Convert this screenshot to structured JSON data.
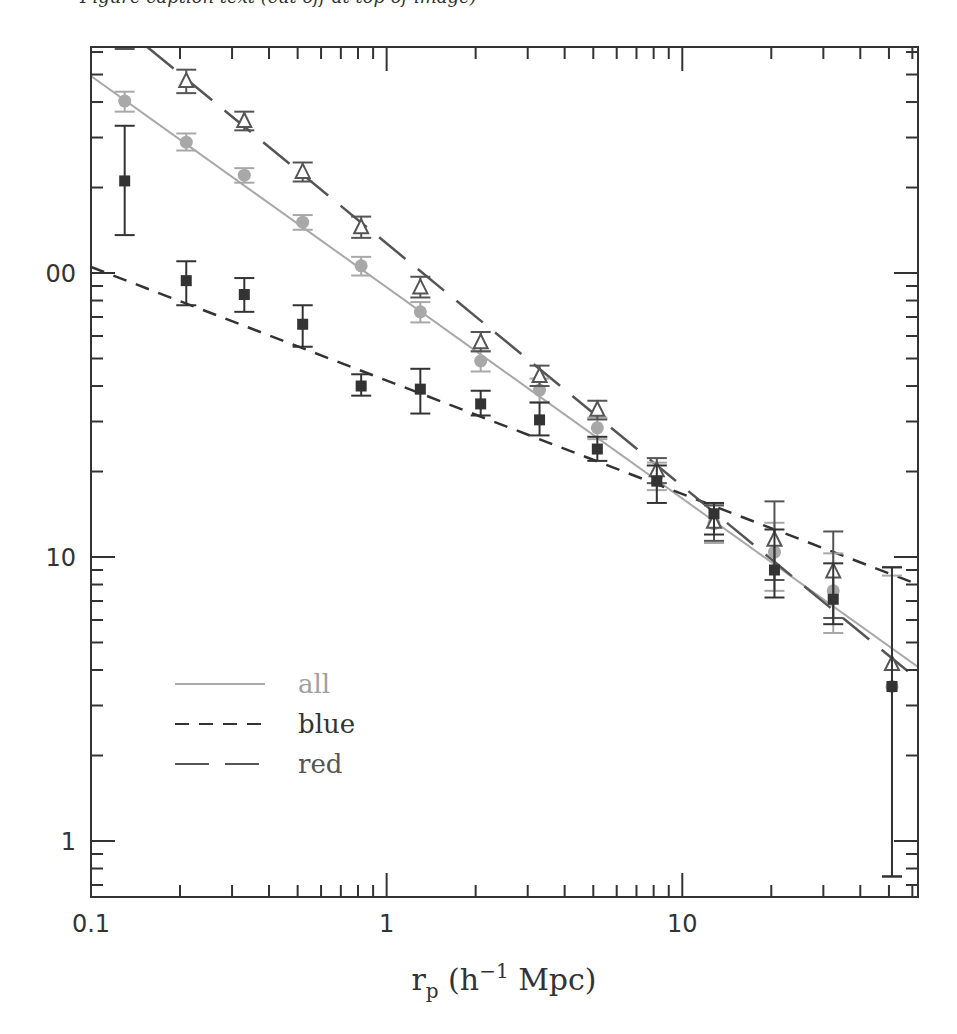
{
  "caption_fragment": "Figure caption text (cut off at top of image)",
  "chart_data": {
    "type": "scatter",
    "title": "",
    "xlabel": "r_p (h^-1 Mpc)",
    "xlabel_parts": {
      "main": "r",
      "sub": "p",
      "open": " (h",
      "sup": "−1",
      "close": " Mpc)"
    },
    "ylabel": "",
    "xscale": "log",
    "yscale": "log",
    "xlim": [
      0.1,
      62.7
    ],
    "ylim": [
      0.635,
      625
    ],
    "xticks": [
      {
        "value": 0.1,
        "label": "0.1"
      },
      {
        "value": 1,
        "label": "1"
      },
      {
        "value": 10,
        "label": "10"
      }
    ],
    "yticks": [
      {
        "value": 1,
        "label": "1"
      },
      {
        "value": 10,
        "label": "10"
      },
      {
        "value": 100,
        "label": "00"
      }
    ],
    "grid": false,
    "legend": {
      "position": "lower-left",
      "entries": [
        {
          "label": "all",
          "style": "solid",
          "color": "#a8a8a8",
          "text_color": "#a0a0a0"
        },
        {
          "label": "blue",
          "style": "short-dash",
          "color": "#333333",
          "text_color": "#333333"
        },
        {
          "label": "red",
          "style": "long-dash",
          "color": "#555555",
          "text_color": "#555555"
        }
      ]
    },
    "x": [
      0.13,
      0.21,
      0.33,
      0.52,
      0.82,
      1.3,
      2.08,
      3.29,
      5.16,
      8.2,
      12.8,
      20.5,
      32.4,
      51.2
    ],
    "series": [
      {
        "name": "all",
        "marker": "circle",
        "color": "#a8a8a8",
        "values": [
          403,
          289,
          221,
          151,
          106,
          73,
          49,
          38.7,
          28.5,
          19.3,
          13.1,
          10.4,
          7.6,
          3.5
        ],
        "err_lo": [
          370,
          270,
          208,
          142,
          98,
          67,
          45,
          35,
          26,
          17.2,
          11.2,
          7.6,
          5.4,
          0.75
        ],
        "err_hi": [
          435,
          310,
          234,
          160,
          114,
          79,
          53,
          42.5,
          31,
          21.5,
          15.2,
          13.2,
          10.3,
          8.6
        ],
        "fit": {
          "x": [
            0.1,
            62.7
          ],
          "y": [
            494,
            4.1
          ]
        }
      },
      {
        "name": "blue",
        "marker": "square",
        "color": "#333333",
        "values": [
          211,
          94,
          84,
          66,
          40,
          39,
          34.6,
          30.4,
          24,
          18.5,
          14.2,
          9.0,
          7.1,
          3.5
        ],
        "err_lo": [
          136,
          77,
          73,
          55,
          37,
          32,
          31.5,
          26.8,
          21.8,
          15.5,
          12,
          7.2,
          5.8,
          0.75
        ],
        "err_hi": [
          330,
          110,
          96,
          77,
          44,
          46,
          38.5,
          35,
          26.5,
          21,
          15.5,
          12.5,
          9.5,
          9.2
        ],
        "fit": {
          "x": [
            0.1,
            62.7
          ],
          "y": [
            105,
            8.0
          ]
        }
      },
      {
        "name": "red",
        "marker": "triangle",
        "color": "#555555",
        "values": [
          800,
          474,
          343,
          227,
          145,
          89,
          57,
          43.4,
          33,
          20.2,
          13.3,
          11.5,
          8.9,
          4.2
        ],
        "err_lo": [
          615,
          430,
          318,
          210,
          133,
          82,
          53,
          40,
          30.5,
          18.2,
          11.4,
          8.3,
          6.1,
          0.75
        ],
        "err_hi": [
          990,
          520,
          370,
          245,
          158,
          97,
          62,
          47.2,
          35.5,
          22.3,
          15.2,
          15.7,
          12.3,
          9.2
        ],
        "fit": {
          "x": [
            0.155,
            62.7
          ],
          "y": [
            625,
            3.7
          ]
        }
      }
    ]
  }
}
